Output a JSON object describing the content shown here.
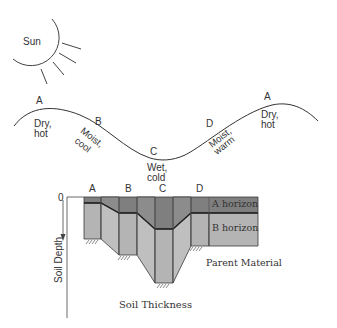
{
  "sun": {
    "label": "Sun"
  },
  "landscape": {
    "points": [
      {
        "letter": "A",
        "condition": [
          "Dry,",
          "hot"
        ]
      },
      {
        "letter": "B",
        "condition": [
          "Moist,",
          "cool"
        ]
      },
      {
        "letter": "C",
        "condition": [
          "Wet,",
          "cold"
        ]
      },
      {
        "letter": "D",
        "condition": [
          "Moist,",
          "warm"
        ]
      },
      {
        "letter": "A",
        "condition": [
          "Dry,",
          "hot"
        ]
      }
    ]
  },
  "profile": {
    "column_labels": [
      "A",
      "B",
      "C",
      "D"
    ],
    "zero_label": "0",
    "y_axis_label": "Soil Depth",
    "x_axis_label": "Soil Thickness",
    "horizons": {
      "a": "A horizon",
      "b": "B horizon",
      "parent": "Parent Material"
    },
    "colors": {
      "a_horizon": "#7f7f7f",
      "b_horizon": "#b4b4b4",
      "a_horizon_ramp": "#8a8a8a",
      "b_horizon_ramp": "#c0c0c0",
      "outline": "#3a3a3a"
    }
  }
}
